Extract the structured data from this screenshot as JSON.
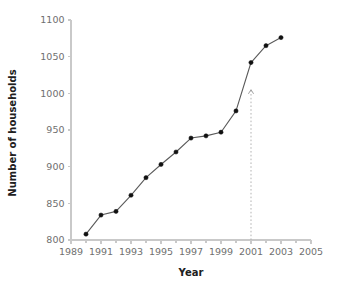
{
  "chart_data": {
    "type": "line",
    "title": "",
    "subtitle": "",
    "xlabel": "Year",
    "ylabel": "Number of households",
    "x": [
      1990,
      1991,
      1992,
      1993,
      1994,
      1995,
      1996,
      1997,
      1998,
      1999,
      2000,
      2001,
      2002,
      2003
    ],
    "values": [
      808,
      834,
      839,
      861,
      885,
      903,
      920,
      939,
      942,
      947,
      976,
      1042,
      1065,
      1076
    ],
    "series": [
      {
        "name": "Number of households",
        "values": [
          808,
          834,
          839,
          861,
          885,
          903,
          920,
          939,
          942,
          947,
          976,
          1042,
          1065,
          1076
        ]
      }
    ],
    "xlim": [
      1989,
      2005
    ],
    "ylim": [
      800,
      1100
    ],
    "xticks": [
      1989,
      1990,
      1991,
      1992,
      1993,
      1994,
      1995,
      1996,
      1997,
      1998,
      1999,
      2000,
      2001,
      2002,
      2003,
      2004,
      2005
    ],
    "xtick_labels_major": [
      "1989",
      "1991",
      "1993",
      "1995",
      "1997",
      "1999",
      "2001",
      "2003",
      "2005"
    ],
    "xticks_major": [
      1989,
      1991,
      1993,
      1995,
      1997,
      1999,
      2001,
      2003,
      2005
    ],
    "yticks": [
      800,
      850,
      900,
      950,
      1000,
      1050,
      1100
    ],
    "ytick_labels": [
      "800",
      "850",
      "900",
      "950",
      "1000",
      "1050",
      "1100"
    ],
    "grid": false,
    "legend": false,
    "legend_position": "none",
    "marker": "circle",
    "annotations": [
      {
        "type": "arrow",
        "style": "dotted-vertical-up",
        "x": 2001,
        "y_start": 800,
        "y_end": 1005,
        "label": ""
      }
    ],
    "colors": {
      "line": "#5a5a5a",
      "marker": "#111111",
      "axis": "#c9c9c9",
      "tick_text": "#6f6f6f",
      "axis_title": "#202020",
      "annotation": "#b3b3b3",
      "background": "#ffffff"
    }
  }
}
